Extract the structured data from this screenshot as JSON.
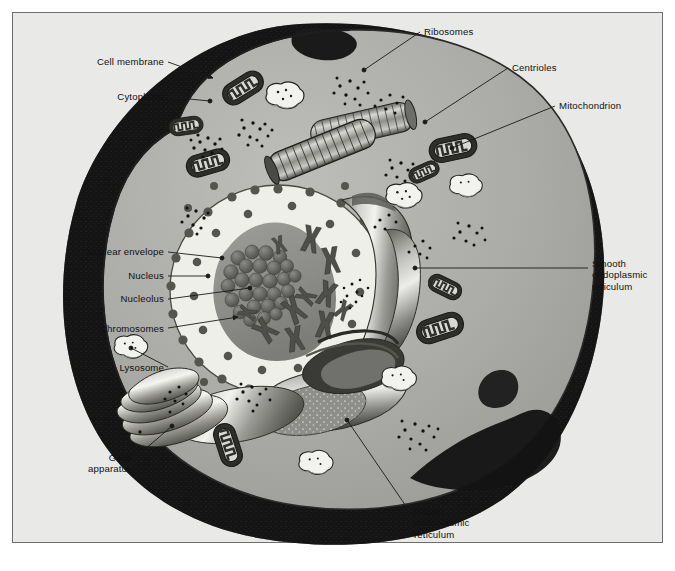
{
  "figure": {
    "kind": "labeled biological illustration",
    "frame_color": "#6e6e6e",
    "background_color": "#e9e9e7"
  },
  "palette": {
    "paper": "#e9e9e7",
    "cytoplasm": "#a9a9a5",
    "cytoplasm_light": "#b8b8b4",
    "shadow_dark": "#141414",
    "membrane_line": "#2a2a2a",
    "nucleoplasm": "#efefe9",
    "nucleus_inner": "#8e8e8a",
    "nucleolus": "#5a5a56",
    "organelle_dark": "#2e2e2c",
    "lysosome_fill": "#f2f2ee",
    "er_light": "#dcdcd8",
    "er_mid": "#8b8b87",
    "golgi_light": "#e4e4e0",
    "leader_line": "#1a1a1a",
    "label_text": "#111111"
  },
  "labels": [
    {
      "id": "cell-membrane",
      "text": "Cell membrane",
      "side": "left",
      "x": 72,
      "y": 56,
      "align": "right",
      "w": 92,
      "leader": [
        [
          168,
          62
        ],
        [
          213,
          78
        ]
      ],
      "tip": "arrow"
    },
    {
      "id": "cytoplasm",
      "text": "Cytoplasm",
      "side": "left",
      "x": 59,
      "y": 91,
      "align": "right",
      "w": 105,
      "leader": [
        [
          168,
          97
        ],
        [
          210,
          101
        ]
      ],
      "tip": "dot"
    },
    {
      "id": "ribosomes",
      "text": "Ribosomes",
      "side": "right",
      "x": 424,
      "y": 26,
      "align": "left",
      "w": 80,
      "leader": [
        [
          420,
          32
        ],
        [
          364,
          70
        ]
      ],
      "tip": "dot"
    },
    {
      "id": "centrioles",
      "text": "Centrioles",
      "side": "right",
      "x": 512,
      "y": 62,
      "align": "left",
      "w": 70,
      "leader": [
        [
          508,
          68
        ],
        [
          425,
          122
        ]
      ],
      "tip": "dot"
    },
    {
      "id": "mitochondrion",
      "text": "Mitochondrion",
      "side": "right",
      "x": 559,
      "y": 100,
      "align": "left",
      "w": 95,
      "leader": [
        [
          555,
          106
        ],
        [
          452,
          148
        ]
      ],
      "tip": "dot"
    },
    {
      "id": "smooth-er",
      "text": "Smooth\nendoplasmic\nreticulum",
      "side": "right",
      "x": 592,
      "y": 258,
      "align": "left",
      "w": 78,
      "leader": [
        [
          588,
          268
        ],
        [
          415,
          268
        ]
      ],
      "tip": "dot"
    },
    {
      "id": "nuclear-envelope",
      "text": "Nuclear envelope",
      "side": "left",
      "x": 31,
      "y": 246,
      "align": "right",
      "w": 133,
      "leader": [
        [
          168,
          252
        ],
        [
          222,
          258
        ]
      ],
      "tip": "dot"
    },
    {
      "id": "nucleus",
      "text": "Nucleus",
      "side": "left",
      "x": 79,
      "y": 270,
      "align": "right",
      "w": 85,
      "leader": [
        [
          168,
          276
        ],
        [
          208,
          276
        ]
      ],
      "tip": "dot"
    },
    {
      "id": "nucleolus",
      "text": "Nucleolus",
      "side": "left",
      "x": 71,
      "y": 293,
      "align": "right",
      "w": 93,
      "leader": [
        [
          168,
          299
        ],
        [
          250,
          288
        ]
      ],
      "tip": "dot"
    },
    {
      "id": "chromosomes",
      "text": "Chromosomes",
      "side": "left",
      "x": 45,
      "y": 323,
      "align": "right",
      "w": 119,
      "leader": [
        [
          168,
          328
        ],
        [
          238,
          317
        ]
      ],
      "tip": "arrow"
    },
    {
      "id": "lysosome",
      "text": "Lysosome",
      "side": "left",
      "x": 72,
      "y": 362,
      "align": "right",
      "w": 92,
      "leader": [
        [
          168,
          367
        ],
        [
          131,
          348
        ]
      ],
      "tip": "dot"
    },
    {
      "id": "golgi-apparatus",
      "text": "Golgi\napparatus",
      "side": "left",
      "x": 60,
      "y": 452,
      "align": "right",
      "w": 72,
      "leader": [
        [
          136,
          457
        ],
        [
          172,
          426
        ]
      ],
      "tip": "dot"
    },
    {
      "id": "rough-er",
      "text": "Rough\nendoplasmic\nreticulum",
      "side": "bottom",
      "x": 414,
      "y": 506,
      "align": "left",
      "w": 80,
      "leader": [
        [
          410,
          512
        ],
        [
          347,
          420
        ]
      ],
      "tip": "dot"
    }
  ],
  "organelles": {
    "mitochondria_count": 8,
    "lysosome_count": 6,
    "centriole_count": 2,
    "ribosome_clusters": 12,
    "nuclear_pore_count": 44,
    "chromosome_count": 11,
    "golgi_cisternae": 5
  }
}
